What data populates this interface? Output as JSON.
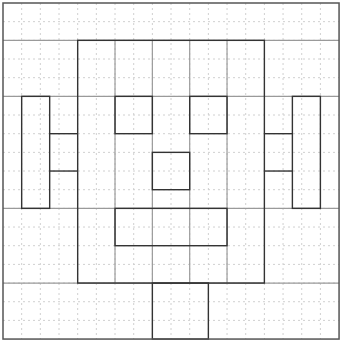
{
  "diagram": {
    "type": "grid-drawing",
    "grid": {
      "cells": 18,
      "origin_px": 3,
      "cell_px": 18.67,
      "dotted_color": "#d0d0d0",
      "border_color": "#555555"
    },
    "colors": {
      "dark_line": "#333333",
      "gray_line": "#9a9a9a"
    },
    "gray_lines": {
      "horizontal_full_width": [
        2,
        5,
        11,
        15
      ],
      "vertical_inside_face": [
        6,
        8,
        10,
        12
      ]
    },
    "shapes": [
      {
        "name": "face",
        "x": 4,
        "y": 2,
        "w": 10,
        "h": 13
      },
      {
        "name": "left-eye",
        "x": 6,
        "y": 5,
        "w": 2,
        "h": 2
      },
      {
        "name": "right-eye",
        "x": 10,
        "y": 5,
        "w": 2,
        "h": 2
      },
      {
        "name": "nose",
        "x": 8,
        "y": 8,
        "w": 2,
        "h": 2
      },
      {
        "name": "mouth",
        "x": 6,
        "y": 11,
        "w": 6,
        "h": 2
      },
      {
        "name": "left-ear",
        "x": 1,
        "y": 5,
        "w": 1.5,
        "h": 6
      },
      {
        "name": "right-ear",
        "x": 15.5,
        "y": 5,
        "w": 1.5,
        "h": 6
      },
      {
        "name": "neck",
        "x": 8,
        "y": 15,
        "w": 3,
        "h": 3
      }
    ],
    "connectors": [
      {
        "name": "left-ear-connector-top",
        "x1": 2.5,
        "y1": 7,
        "x2": 4,
        "y2": 7
      },
      {
        "name": "left-ear-connector-bottom",
        "x1": 2.5,
        "y1": 9,
        "x2": 4,
        "y2": 9
      },
      {
        "name": "right-ear-connector-top",
        "x1": 14,
        "y1": 7,
        "x2": 15.5,
        "y2": 7
      },
      {
        "name": "right-ear-connector-bottom",
        "x1": 14,
        "y1": 9,
        "x2": 15.5,
        "y2": 9
      }
    ]
  }
}
